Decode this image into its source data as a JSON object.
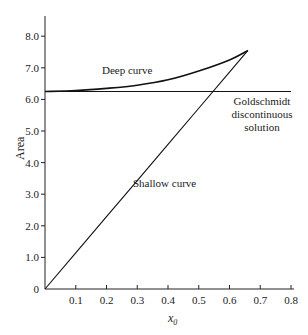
{
  "chart_data": {
    "type": "line",
    "title": "",
    "xlabel": "x0",
    "ylabel": "Area",
    "xlim": [
      0,
      0.8
    ],
    "ylim": [
      0,
      8.6
    ],
    "grid": false,
    "legend": "none (inline annotations)",
    "x_ticks": [
      "0.1",
      "0.2",
      "0.3",
      "0.4",
      "0.5",
      "0.6",
      "0.7",
      "0.8"
    ],
    "y_ticks": [
      "0",
      "1.0",
      "2.0",
      "3.0",
      "4.0",
      "5.0",
      "6.0",
      "7.0",
      "8.0"
    ],
    "series": [
      {
        "name": "Deep curve",
        "x": [
          0,
          0.1,
          0.2,
          0.3,
          0.4,
          0.5,
          0.6,
          0.66
        ],
        "y": [
          6.25,
          6.28,
          6.35,
          6.45,
          6.62,
          6.9,
          7.25,
          7.55
        ]
      },
      {
        "name": "Shallow curve",
        "x": [
          0,
          0.1,
          0.2,
          0.3,
          0.4,
          0.5,
          0.6,
          0.66
        ],
        "y": [
          0,
          1.14,
          2.29,
          3.43,
          4.58,
          5.72,
          6.86,
          7.55
        ]
      },
      {
        "name": "Goldschmidt discontinuous solution",
        "x": [
          0,
          0.8
        ],
        "y": [
          6.25,
          6.25
        ]
      }
    ],
    "annotations": [
      {
        "text": "Deep curve",
        "x": 0.33,
        "y": 7.0
      },
      {
        "text": "Shallow curve",
        "x": 0.29,
        "y": 3.6
      },
      {
        "text": "Goldschmidt discontinuous solution",
        "x": 0.72,
        "y": 5.7
      }
    ]
  },
  "labels": {
    "x_axis": "x",
    "x_axis_sub": "0",
    "y_axis": "Area",
    "deep": "Deep curve",
    "shallow": "Shallow curve",
    "gold_line1": "Goldschmidt",
    "gold_line2": "discontinuous",
    "gold_line3": "solution"
  }
}
